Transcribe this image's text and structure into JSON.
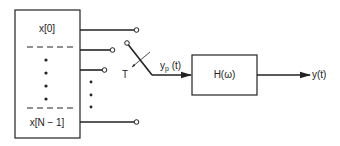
{
  "diagram": {
    "register": {
      "top_label": "x[0]",
      "bottom_label": "x[N − 1]"
    },
    "switch": {
      "label": "T"
    },
    "signal": {
      "label_main": "y",
      "label_sub": "p",
      "label_suffix": " (t)"
    },
    "filter": {
      "label": "H(ω)"
    },
    "output": {
      "label": "y(t)"
    },
    "colors": {
      "stroke": "#222222",
      "background": "#ffffff"
    }
  }
}
